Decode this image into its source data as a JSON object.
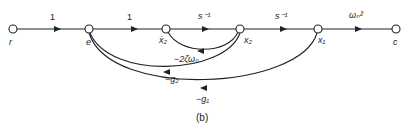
{
  "diagram": {
    "type": "signal-flow-graph",
    "caption": "(b)",
    "nodes": [
      {
        "id": "r",
        "label": "r"
      },
      {
        "id": "e",
        "label": "e"
      },
      {
        "id": "x2dot",
        "label": "ẋ₂"
      },
      {
        "id": "x2",
        "label": "x₂"
      },
      {
        "id": "x1",
        "label": "x₁"
      },
      {
        "id": "c",
        "label": "c"
      }
    ],
    "forward_edges": [
      {
        "from": "r",
        "to": "e",
        "gain": "1"
      },
      {
        "from": "e",
        "to": "x2dot",
        "gain": "1"
      },
      {
        "from": "x2dot",
        "to": "x2",
        "gain": "s⁻¹"
      },
      {
        "from": "x2",
        "to": "x1",
        "gain": "s⁻¹"
      },
      {
        "from": "x1",
        "to": "c",
        "gain": "ωₙ²"
      }
    ],
    "feedback_edges": [
      {
        "from": "x2",
        "to": "x2dot",
        "gain": "−2ζωₙ"
      },
      {
        "from": "x2",
        "to": "e",
        "gain": "−g₂"
      },
      {
        "from": "x1",
        "to": "e",
        "gain": "−g₁"
      }
    ]
  }
}
